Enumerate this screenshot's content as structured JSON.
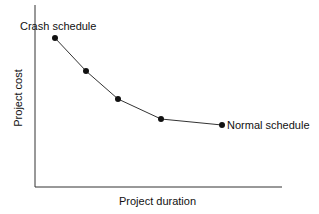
{
  "chart_data": {
    "type": "line",
    "title": "",
    "xlabel": "Project duration",
    "ylabel": "Project cost",
    "grid": false,
    "series": [
      {
        "name": "Time-cost tradeoff",
        "points": [
          {
            "x": 1,
            "y": 5.0
          },
          {
            "x": 2,
            "y": 3.7
          },
          {
            "x": 3,
            "y": 2.6
          },
          {
            "x": 4,
            "y": 1.8
          },
          {
            "x": 5,
            "y": 1.55
          }
        ]
      }
    ],
    "annotations": [
      {
        "text": "Crash schedule",
        "point_index": 0
      },
      {
        "text": "Normal schedule",
        "point_index": 4
      }
    ],
    "pixel_points": [
      [
        55,
        38
      ],
      [
        86,
        71
      ],
      [
        118,
        99
      ],
      [
        161,
        119
      ],
      [
        222,
        125
      ]
    ]
  },
  "labels": {
    "xlabel": "Project duration",
    "ylabel": "Project cost",
    "crash": "Crash schedule",
    "normal": "Normal schedule"
  }
}
